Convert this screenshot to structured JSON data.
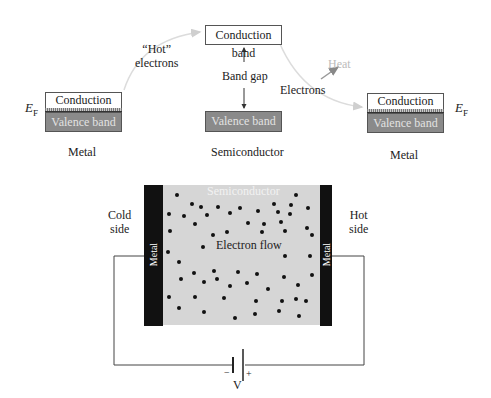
{
  "top_diagram": {
    "left_metal": {
      "conduction_band": "Conduction band",
      "valence_band": "Valence band",
      "fermi_label": "E",
      "fermi_sub": "F",
      "caption": "Metal"
    },
    "semiconductor": {
      "conduction_band": "Conduction band",
      "valence_band": "Valence band",
      "band_gap_label": "Band gap",
      "caption": "Semiconductor"
    },
    "right_metal": {
      "conduction_band": "Conduction band",
      "valence_band": "Valence band",
      "fermi_label": "E",
      "fermi_sub": "F",
      "caption": "Metal"
    },
    "hot_electrons_label_line1": "“Hot”",
    "hot_electrons_label_line2": "electrons",
    "electrons_label": "Electrons",
    "heat_label": "Heat"
  },
  "bottom_diagram": {
    "semiconductor_label": "Semiconductor",
    "left_metal_label": "Metal",
    "right_metal_label": "Metal",
    "cold_side_line1": "Cold",
    "cold_side_line2": "side",
    "hot_side_line1": "Hot",
    "hot_side_line2": "side",
    "electron_flow_label": "Electron flow",
    "battery_minus": "−",
    "battery_plus": "+",
    "battery_label": "V"
  },
  "colors": {
    "valence_fill": "#8a8a8a",
    "semiconductor_fill": "#d6d6d6",
    "metal_fill": "#111111",
    "faint_arrow": "#d8d8d8",
    "heat_arrow": "#9a9a9a"
  }
}
